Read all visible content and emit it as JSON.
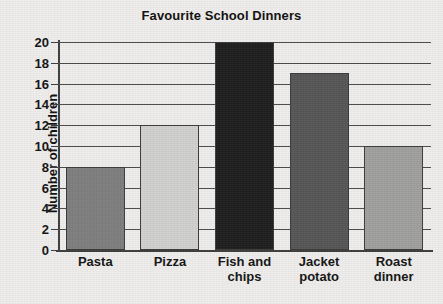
{
  "chart_data": {
    "type": "bar",
    "title": "Favourite School Dinners",
    "xlabel": "",
    "ylabel": "Number of children",
    "categories": [
      "Pasta",
      "Pizza",
      "Fish and chips",
      "Jacket potato",
      "Roast dinner"
    ],
    "category_lines": [
      [
        "Pasta"
      ],
      [
        "Pizza"
      ],
      [
        "Fish and",
        "chips"
      ],
      [
        "Jacket",
        "potato"
      ],
      [
        "Roast",
        "dinner"
      ]
    ],
    "values": [
      8,
      12,
      20,
      17,
      10
    ],
    "ylim": [
      0,
      20
    ],
    "ytick_step": 2,
    "yticks": [
      20,
      18,
      16,
      14,
      12,
      10,
      8,
      6,
      4,
      2,
      0
    ],
    "ytick_labels": [
      "20",
      "18",
      "16",
      "14",
      "12",
      "10",
      "8",
      "6",
      "4",
      "2",
      "0"
    ],
    "grid": true,
    "legend": false,
    "bar_colors": [
      "#7d7d7d",
      "#cfcfcd",
      "#1d1d1d",
      "#555555",
      "#9e9e9c"
    ],
    "bar_edge_color": "#3a3a3a",
    "grid_color": "#4a4a4a",
    "axis_color": "#3c3c3c",
    "background_color": "#eeedeb",
    "text_color": "#111111"
  }
}
